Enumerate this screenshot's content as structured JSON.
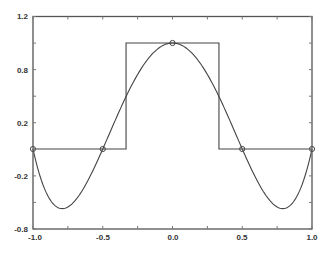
{
  "chart_data": {
    "type": "line",
    "title": "",
    "xlabel": "",
    "ylabel": "",
    "xlim": [
      -1.0,
      1.0
    ],
    "ylim": [
      -0.8,
      1.2
    ],
    "grid": false,
    "legend": null,
    "x_ticks": [
      "-1.0",
      "-0.5",
      "0.0",
      "0.5",
      "1.0"
    ],
    "y_ticks": [
      "1.2",
      "0.8",
      "0.2",
      "-0.2",
      "-0.8"
    ],
    "series": [
      {
        "name": "square pulse",
        "style": "step",
        "x": [
          -1.0,
          -0.333,
          -0.333,
          0.333,
          0.333,
          1.0
        ],
        "y": [
          0,
          0,
          1,
          1,
          0,
          0
        ]
      },
      {
        "name": "interpolating polynomial 4(x^2-1)(x^2-0.25)",
        "style": "smooth-line",
        "x": [
          -1.0,
          -0.9,
          -0.79,
          -0.7,
          -0.6,
          -0.5,
          -0.4,
          -0.3,
          -0.2,
          -0.1,
          0.0,
          0.1,
          0.2,
          0.3,
          0.4,
          0.5,
          0.6,
          0.7,
          0.79,
          0.9,
          1.0
        ],
        "y": [
          0.0,
          -0.426,
          -0.5625,
          -0.49,
          -0.282,
          0.0,
          0.302,
          0.582,
          0.806,
          0.95,
          1.0,
          0.95,
          0.806,
          0.582,
          0.302,
          0.0,
          -0.282,
          -0.49,
          -0.5625,
          -0.426,
          0.0
        ]
      },
      {
        "name": "interpolation nodes",
        "style": "circle-markers",
        "x": [
          -1.0,
          -0.5,
          0.0,
          0.5,
          1.0
        ],
        "y": [
          0,
          0,
          1,
          0,
          0
        ]
      }
    ]
  },
  "axes": {
    "x_labels": [
      "-1.0",
      "-0.5",
      "0.0",
      "0.5",
      "1.0"
    ],
    "y_labels": [
      "1.2",
      "0.8",
      "0.2",
      "-0.2",
      "-0.8"
    ]
  }
}
